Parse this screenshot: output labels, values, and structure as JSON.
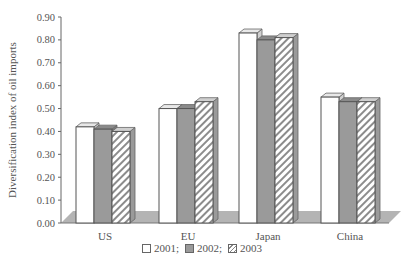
{
  "chart_data": {
    "type": "bar",
    "title": "",
    "xlabel": "",
    "ylabel": "Diversification index of oil imports",
    "ylim": [
      0,
      0.9
    ],
    "yticks": [
      "0.00",
      "0.10",
      "0.20",
      "0.30",
      "0.40",
      "0.50",
      "0.60",
      "0.70",
      "0.80",
      "0.90"
    ],
    "categories": [
      "US",
      "EU",
      "Japan",
      "China"
    ],
    "series": [
      {
        "name": "2001",
        "values": [
          0.42,
          0.5,
          0.83,
          0.55
        ],
        "fill": "#ffffff",
        "pattern": "solid-white"
      },
      {
        "name": "2002",
        "values": [
          0.41,
          0.5,
          0.8,
          0.53
        ],
        "fill": "#9a9a9a",
        "pattern": "solid-gray"
      },
      {
        "name": "2003",
        "values": [
          0.4,
          0.53,
          0.81,
          0.53
        ],
        "fill": "#ffffff",
        "pattern": "diagonal-hatch"
      }
    ],
    "legend": {
      "position": "bottom",
      "entries": [
        "2001;",
        "2002;",
        "2003"
      ]
    },
    "grid": false,
    "style": "3d-bar"
  }
}
